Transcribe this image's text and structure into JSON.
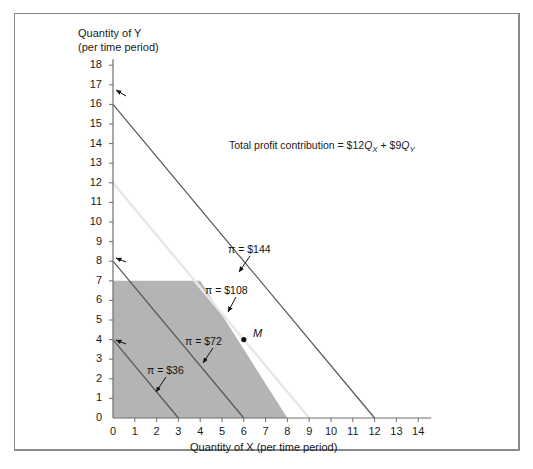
{
  "figure": {
    "axis_titles": {
      "y": "Quantity of Y\n(per time period)",
      "x": "Quantity of X (per time period)"
    },
    "equation_label": "Total profit contribution = $12QX + $9QY",
    "equation_parts": {
      "prefix": "Total profit contribution = $12",
      "q1": "Q",
      "sub1": "X",
      "mid": " + $9",
      "q2": "Q",
      "sub2": "Y"
    },
    "point_label": "M",
    "colors": {
      "feasible_fill": "#b4b4b4",
      "line_dark": "#555555",
      "line_light": "#e8e8e8",
      "axis": "#6e6e6e",
      "frame": "#8a8a8a",
      "text": "#1a1a1a"
    }
  },
  "chart_data": {
    "type": "line",
    "title": "",
    "xlabel": "Quantity of X (per time period)",
    "ylabel": "Quantity of Y (per time period)",
    "xlim": [
      0,
      14
    ],
    "ylim": [
      0,
      18
    ],
    "grid": false,
    "legend_position": "none",
    "xticks": [
      "0",
      "1",
      "2",
      "3",
      "4",
      "5",
      "6",
      "7",
      "8",
      "9",
      "10",
      "11",
      "12",
      "13",
      "14"
    ],
    "yticks": [
      "0",
      "1",
      "2",
      "3",
      "4",
      "5",
      "6",
      "7",
      "8",
      "9",
      "10",
      "11",
      "12",
      "13",
      "14",
      "15",
      "16",
      "17",
      "18"
    ],
    "objective": "Total profit contribution = $12QX + $9QY",
    "series": [
      {
        "name": "π = $36",
        "label": "π = $36",
        "value": 36,
        "color": "#555555",
        "x": [
          0,
          3
        ],
        "y": [
          4,
          0
        ]
      },
      {
        "name": "π = $72",
        "label": "π = $72",
        "value": 72,
        "color": "#555555",
        "x": [
          0,
          6
        ],
        "y": [
          8,
          0
        ]
      },
      {
        "name": "π = $108",
        "label": "π = $108",
        "value": 108,
        "color": "#e8e8e8",
        "x": [
          0,
          9
        ],
        "y": [
          12,
          0
        ]
      },
      {
        "name": "π = $144",
        "label": "π = $144",
        "value": 144,
        "color": "#555555",
        "x": [
          0,
          12
        ],
        "y": [
          16,
          0
        ]
      }
    ],
    "feasible_region": {
      "name": "feasible region",
      "fill": "#b4b4b4",
      "vertices": [
        [
          0,
          0
        ],
        [
          0,
          7
        ],
        [
          4,
          7
        ],
        [
          8,
          0
        ]
      ]
    },
    "points": [
      {
        "label": "M",
        "x": 6,
        "y": 4
      }
    ],
    "annotations": [
      {
        "text": "π = $144",
        "x": 6.6,
        "y": 9.0
      },
      {
        "text": "π = $108",
        "x": 5.4,
        "y": 6.9
      },
      {
        "text": "π = $72",
        "x": 4.4,
        "y": 4.3
      },
      {
        "text": "π = $36",
        "x": 2.7,
        "y": 2.8
      },
      {
        "text": "Total profit contribution = $12QX + $9QY",
        "x": 6.4,
        "y": 14.2
      }
    ]
  }
}
